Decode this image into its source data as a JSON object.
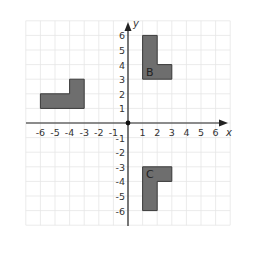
{
  "diagram": {
    "type": "coordinate-plane",
    "axes": {
      "x_label": "x",
      "y_label": "y",
      "x_range": [
        -6,
        6
      ],
      "y_range": [
        -6,
        6
      ],
      "x_ticks": [
        "-6",
        "-5",
        "-4",
        "-3",
        "-2",
        "-1",
        "1",
        "2",
        "3",
        "4",
        "5",
        "6"
      ],
      "y_ticks_pos": [
        "1",
        "2",
        "3",
        "4",
        "5",
        "6"
      ],
      "y_ticks_neg": [
        "-1",
        "-2",
        "-3",
        "-4",
        "-5",
        "-6"
      ]
    },
    "colors": {
      "shape_fill": "#6e6e6e",
      "shape_stroke": "#3a3a3a",
      "grid": "#e6e6e6",
      "axis": "#222222",
      "text": "#333333"
    },
    "shapes": [
      {
        "name": "shape-a",
        "label": "",
        "vertices": [
          [
            -6,
            1
          ],
          [
            -3,
            1
          ],
          [
            -3,
            3
          ],
          [
            -4,
            3
          ],
          [
            -4,
            2
          ],
          [
            -6,
            2
          ]
        ]
      },
      {
        "name": "shape-b",
        "label": "B",
        "label_pos": [
          1.5,
          3.5
        ],
        "vertices": [
          [
            1,
            6
          ],
          [
            2,
            6
          ],
          [
            2,
            4
          ],
          [
            3,
            4
          ],
          [
            3,
            3
          ],
          [
            1,
            3
          ]
        ]
      },
      {
        "name": "shape-c",
        "label": "C",
        "label_pos": [
          1.5,
          -3.5
        ],
        "vertices": [
          [
            1,
            -3
          ],
          [
            3,
            -3
          ],
          [
            3,
            -4
          ],
          [
            2,
            -4
          ],
          [
            2,
            -6
          ],
          [
            1,
            -6
          ]
        ]
      }
    ]
  }
}
